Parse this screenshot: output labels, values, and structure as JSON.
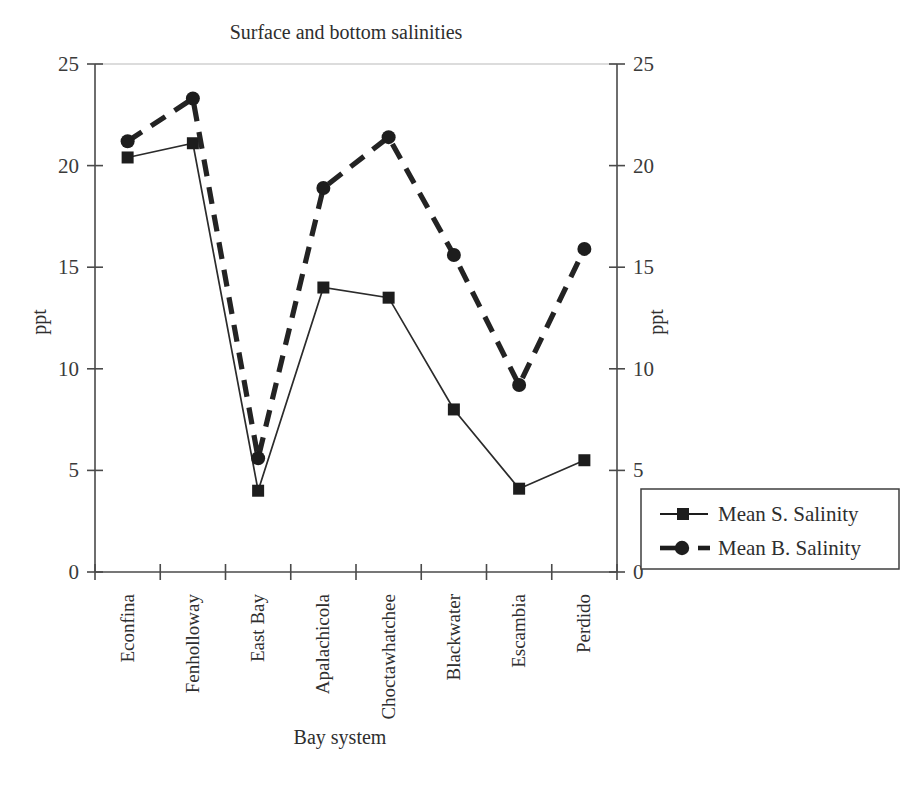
{
  "chart_data": {
    "type": "line",
    "title": "Surface and bottom salinities",
    "xlabel": "Bay system",
    "ylabel": "ppt",
    "ylabel_right": "ppt",
    "categories": [
      "Econfina",
      "Fenholloway",
      "East Bay",
      "Apalachicola",
      "Choctawhatchee",
      "Blackwater",
      "Escambia",
      "Perdido"
    ],
    "series": [
      {
        "name": "Mean S. Salinity",
        "values": [
          20.4,
          21.1,
          4.0,
          14.0,
          13.5,
          8.0,
          4.1,
          5.5
        ],
        "marker": "square",
        "line_style": "solid",
        "color": "#1d1d1d"
      },
      {
        "name": "Mean B. Salinity",
        "values": [
          21.2,
          23.3,
          5.6,
          18.9,
          21.4,
          15.6,
          9.2,
          15.9
        ],
        "marker": "circle",
        "line_style": "dashed",
        "color": "#1d1d1d"
      }
    ],
    "ylim": [
      0,
      25
    ],
    "yticks": [
      0,
      5,
      10,
      15,
      20,
      25
    ],
    "ytick_labels": [
      "0",
      "5",
      "10",
      "15",
      "20",
      "25"
    ],
    "yticks_right": [
      0,
      5,
      10,
      15,
      20,
      25
    ],
    "ytick_labels_right": [
      "0",
      "5",
      "10",
      "15",
      "20",
      "25"
    ],
    "grid": false,
    "legend_position": "right-bottom",
    "xtick_rotation": 90
  },
  "legend": {
    "entries": [
      {
        "label": "Mean S. Salinity"
      },
      {
        "label": "Mean B. Salinity"
      }
    ]
  }
}
